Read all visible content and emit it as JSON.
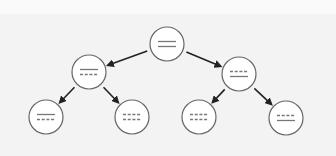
{
  "diagram": {
    "type": "binary-tree",
    "colors": {
      "background": "#f3f3f3",
      "node_fill": "#ffffff",
      "node_stroke": "#666666",
      "line_color": "#777777",
      "arrow_color": "#222222"
    },
    "nodes": [
      {
        "id": "root",
        "cx": 167,
        "cy": 44,
        "r": 17,
        "lines": [
          "solid",
          "solid"
        ]
      },
      {
        "id": "left-mid",
        "cx": 89,
        "cy": 72,
        "r": 17,
        "lines": [
          "solid",
          "dashed"
        ]
      },
      {
        "id": "right-mid",
        "cx": 239,
        "cy": 74,
        "r": 17,
        "lines": [
          "dashed",
          "solid"
        ]
      },
      {
        "id": "leaf-1",
        "cx": 46,
        "cy": 117,
        "r": 17,
        "lines": [
          "solid",
          "dashed"
        ]
      },
      {
        "id": "leaf-2",
        "cx": 132,
        "cy": 117,
        "r": 17,
        "lines": [
          "dashed",
          "dashed"
        ]
      },
      {
        "id": "leaf-3",
        "cx": 199,
        "cy": 117,
        "r": 17,
        "lines": [
          "dashed",
          "dashed"
        ]
      },
      {
        "id": "leaf-4",
        "cx": 286,
        "cy": 118,
        "r": 17,
        "lines": [
          "dashed",
          "solid"
        ]
      }
    ],
    "edges": [
      {
        "from": "root",
        "to": "left-mid"
      },
      {
        "from": "root",
        "to": "right-mid"
      },
      {
        "from": "left-mid",
        "to": "leaf-1"
      },
      {
        "from": "left-mid",
        "to": "leaf-2"
      },
      {
        "from": "right-mid",
        "to": "leaf-3"
      },
      {
        "from": "right-mid",
        "to": "leaf-4"
      }
    ]
  }
}
